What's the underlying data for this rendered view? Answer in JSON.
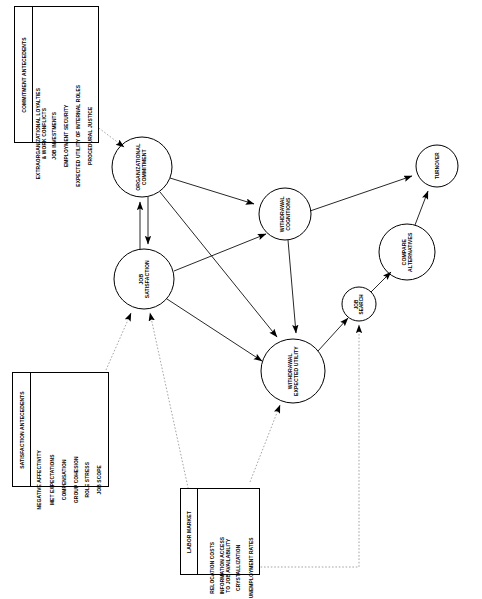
{
  "diagram": {
    "nodes": [
      {
        "id": "organizational-commitment",
        "label": "ORGANIZATIONAL\nCOMMITMENT",
        "cx": 142,
        "cy": 167,
        "r": 30
      },
      {
        "id": "withdrawal-cognitions",
        "label": "WITHDRAWAL\nCOGNITIONS",
        "cx": 285,
        "cy": 214,
        "r": 26
      },
      {
        "id": "job-satisfaction",
        "label": "JOB\nSATISFACTION",
        "cx": 144,
        "cy": 279,
        "r": 30
      },
      {
        "id": "withdrawal-expected-utility",
        "label": "WITHDRAWAL\nEXPECTED UTILITY",
        "cx": 293,
        "cy": 371,
        "r": 32
      },
      {
        "id": "job-search",
        "label": "JOB\nSEARCH",
        "cx": 359,
        "cy": 304,
        "r": 17
      },
      {
        "id": "compare-alternatives",
        "label": "COMPARE\nALTERNATIVES",
        "cx": 407,
        "cy": 252,
        "r": 28
      },
      {
        "id": "turnover",
        "label": "TURNOVER",
        "cx": 437,
        "cy": 166,
        "r": 21
      }
    ],
    "edges": [
      {
        "from": "organizational-commitment",
        "to": "withdrawal-cognitions",
        "style": "solid"
      },
      {
        "from": "organizational-commitment",
        "to": "withdrawal-expected-utility",
        "style": "solid"
      },
      {
        "from": "job-satisfaction",
        "to": "organizational-commitment",
        "style": "solid"
      },
      {
        "from": "organizational-commitment",
        "to": "job-satisfaction",
        "style": "solid"
      },
      {
        "from": "job-satisfaction",
        "to": "withdrawal-cognitions",
        "style": "solid"
      },
      {
        "from": "job-satisfaction",
        "to": "withdrawal-expected-utility",
        "style": "solid"
      },
      {
        "from": "withdrawal-cognitions",
        "to": "turnover",
        "style": "solid"
      },
      {
        "from": "withdrawal-cognitions",
        "to": "withdrawal-expected-utility",
        "style": "solid"
      },
      {
        "from": "withdrawal-expected-utility",
        "to": "job-search",
        "style": "solid"
      },
      {
        "from": "job-search",
        "to": "compare-alternatives",
        "style": "solid"
      },
      {
        "from": "compare-alternatives",
        "to": "turnover",
        "style": "solid"
      },
      {
        "from": "commitment-antecedents",
        "to": "organizational-commitment",
        "style": "dotted"
      },
      {
        "from": "satisfaction-antecedents",
        "to": "job-satisfaction",
        "style": "dotted"
      },
      {
        "from": "labor-market",
        "to": "job-satisfaction",
        "style": "dotted"
      },
      {
        "from": "labor-market",
        "to": "withdrawal-expected-utility",
        "style": "dotted"
      },
      {
        "from": "labor-market",
        "to": "job-search",
        "style": "dotted"
      }
    ],
    "boxes": [
      {
        "id": "commitment-antecedents",
        "heading": "COMMITMENT ANTECEDENTS",
        "items": [
          "PROCEDURAL JUSTICE",
          "EXPECTED UTILITY OF INTERNAL ROLES",
          "EMPLOYMENT SECURITY",
          "JOB INVESTMENTS",
          "EXTRAORGANIZATIONAL LOYALTIES\n& WORK CONFLICTS"
        ]
      },
      {
        "id": "satisfaction-antecedents",
        "heading": "SATISFACTION ANTECEDENTS",
        "items": [
          "JOB SCOPE",
          "ROLE STRESS",
          "GROUP COHESION",
          "COMPENSATION",
          "MET EXPECTATIONS",
          "NEGATIVE AFFECTIVITY"
        ]
      },
      {
        "id": "labor-market",
        "heading": "LABOR MARKET",
        "items": [
          "UNEMPLOYMENT RATES",
          "CRYSTALLIZATION",
          "INFORMATION ACCESS\nTO JOB AVAILABILITY",
          "RELOCATION COSTS"
        ]
      }
    ],
    "colors": {
      "stroke": "#000000",
      "background": "#ffffff",
      "text": "#000000"
    }
  }
}
